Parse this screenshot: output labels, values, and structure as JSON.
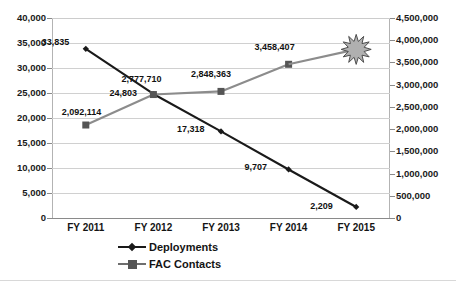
{
  "chart_data": {
    "type": "line",
    "title": "",
    "subtitle": "",
    "xlabel": "",
    "categories": [
      "FY 2011",
      "FY 2012",
      "FY 2013",
      "FY 2014",
      "FY 2015"
    ],
    "grid": true,
    "legend_position": "bottom",
    "axes": {
      "left": {
        "label": "",
        "ylim": [
          0,
          40000
        ],
        "tick_step": 5000,
        "ticks": [
          "0",
          "5,000",
          "10,000",
          "15,000",
          "20,000",
          "25,000",
          "30,000",
          "35,000",
          "40,000"
        ],
        "tick_values": [
          0,
          5000,
          10000,
          15000,
          20000,
          25000,
          30000,
          35000,
          40000
        ]
      },
      "right": {
        "label": "",
        "ylim": [
          0,
          4500000
        ],
        "tick_step": 500000,
        "ticks": [
          "0",
          "500,000",
          "1,000,000",
          "1,500,000",
          "2,000,000",
          "2,500,000",
          "3,000,000",
          "3,500,000",
          "4,000,000",
          "4,500,000"
        ],
        "tick_values": [
          0,
          500000,
          1000000,
          1500000,
          2000000,
          2500000,
          3000000,
          3500000,
          4000000,
          4500000
        ]
      }
    },
    "series": [
      {
        "name": "Deployments",
        "axis": "left",
        "marker": "diamond",
        "color": "#1a1a1a",
        "values": [
          33835,
          24803,
          17318,
          9707,
          2209
        ],
        "data_labels": [
          "33,835",
          "24,803",
          "17,318",
          "9,707",
          "2,209"
        ]
      },
      {
        "name": "FAC Contacts",
        "axis": "right",
        "marker": "square",
        "color": "#8c8c8c",
        "values": [
          2092114,
          2777710,
          2848363,
          3458407,
          null
        ],
        "data_labels": [
          "2,092,114",
          "2,777,710",
          "2,848,363",
          "3,458,407",
          ""
        ]
      }
    ],
    "annotations": [
      {
        "type": "starburst",
        "name": "fy2015-fac-contacts-starburst",
        "at_category": "FY 2015",
        "series": "FAC Contacts",
        "label": "",
        "fill": "#b0b0b0",
        "stroke": "#4d4d4d"
      }
    ],
    "colors": {
      "deployments": "#1a1a1a",
      "fac_contacts": "#8c8c8c",
      "gridline": "#d0d0d0",
      "axis": "#8a8a8a",
      "background": "#ffffff",
      "text": "#141414"
    }
  },
  "legend": {
    "items": [
      {
        "label": "Deployments",
        "marker": "diamond-marker",
        "color": "#1a1a1a"
      },
      {
        "label": "FAC Contacts",
        "marker": "square-marker",
        "color": "#8c8c8c"
      }
    ]
  }
}
